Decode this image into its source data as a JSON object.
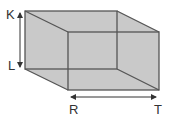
{
  "diagram": {
    "type": "cuboid-wireframe",
    "colors": {
      "fill": "#c9c9c9",
      "edge": "#555555",
      "arrow": "#333333",
      "text": "#333333"
    },
    "back_face": {
      "x1": 25,
      "y1": 11,
      "x2": 117,
      "y2": 69
    },
    "front_face": {
      "x1": 68,
      "y1": 32,
      "x2": 159,
      "y2": 90
    },
    "labels": {
      "K": "K",
      "L": "L",
      "R": "R",
      "T": "T"
    },
    "dimensions": [
      {
        "name": "height",
        "from": "K",
        "to": "L"
      },
      {
        "name": "length",
        "from": "R",
        "to": "T"
      }
    ]
  }
}
